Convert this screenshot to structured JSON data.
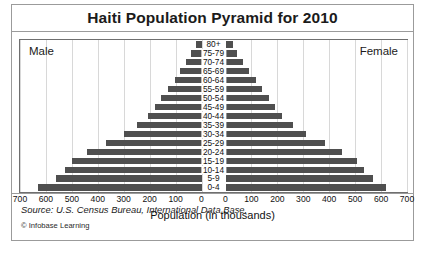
{
  "chart_data": {
    "type": "bar",
    "title": "Haiti Population Pyramid for 2010",
    "subtype": "population-pyramid",
    "xlabel": "Population (in thousands)",
    "ylabel": "",
    "categories": [
      "80+",
      "75-79",
      "70-74",
      "65-69",
      "60-64",
      "55-59",
      "50-54",
      "45-49",
      "40-44",
      "35-39",
      "30-34",
      "25-29",
      "20-24",
      "15-19",
      "10-14",
      "5-9",
      "0-4"
    ],
    "series": [
      {
        "name": "Male",
        "side": "left",
        "values": [
          22,
          40,
          60,
          82,
          104,
          128,
          155,
          180,
          205,
          250,
          300,
          370,
          440,
          500,
          525,
          560,
          632
        ]
      },
      {
        "name": "Female",
        "side": "right",
        "values": [
          28,
          46,
          68,
          92,
          116,
          140,
          168,
          192,
          218,
          262,
          312,
          382,
          450,
          508,
          535,
          568,
          618
        ]
      }
    ],
    "axis_ticks_left": [
      "700",
      "600",
      "500",
      "400",
      "300",
      "200",
      "100",
      "0"
    ],
    "axis_ticks_right": [
      "0",
      "100",
      "200",
      "300",
      "400",
      "500",
      "600",
      "700"
    ],
    "xlim": [
      0,
      700
    ],
    "xtick_step": 100,
    "grid": true,
    "legend": "inline-side-captions",
    "bar_color": "#4f4f4f",
    "grid_color": "#d8d8d8"
  },
  "figure": {
    "title": "Haiti Population Pyramid for 2010",
    "caption_male": "Male",
    "caption_female": "Female",
    "axis_title": "Population (in thousands)",
    "source": "Source: U.S. Census Bureau, International Data Base.",
    "copyright": "© Infobase Learning"
  }
}
